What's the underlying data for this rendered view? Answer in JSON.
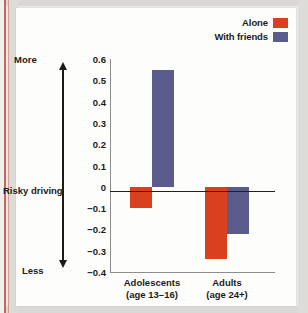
{
  "chart_data": {
    "type": "bar",
    "title": "",
    "xlabel": "",
    "ylabel": "Risky driving",
    "ylim": [
      -0.4,
      0.6
    ],
    "ytick_labels": [
      "0.6",
      "0.5",
      "0.4",
      "0.3",
      "0.2",
      "0.1",
      "0",
      "−0.1",
      "−0.2",
      "−0.3",
      "−0.4"
    ],
    "ytick_values": [
      0.6,
      0.5,
      0.4,
      0.3,
      0.2,
      0.1,
      0,
      -0.1,
      -0.2,
      -0.3,
      -0.4
    ],
    "grid": false,
    "legend_position": "top-right",
    "categories": [
      "Adolescents",
      "Adults"
    ],
    "category_sublabels": [
      "(age 13–16)",
      "(age 24+)"
    ],
    "series": [
      {
        "name": "Alone",
        "color": "#d8401e",
        "values": [
          -0.1,
          -0.34
        ]
      },
      {
        "name": "With friends",
        "color": "#5b5a8c",
        "values": [
          0.55,
          -0.22
        ]
      }
    ],
    "axis_direction_labels": {
      "top": "More",
      "bottom": "Less"
    }
  },
  "legend": {
    "items": [
      {
        "label": "Alone",
        "color": "#d8401e"
      },
      {
        "label": "With friends",
        "color": "#5b5a8c"
      }
    ]
  },
  "axis": {
    "more": "More",
    "less": "Less",
    "title": "Risky driving"
  }
}
